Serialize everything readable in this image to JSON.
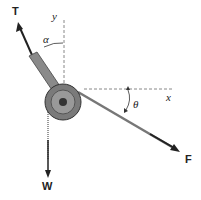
{
  "diagram": {
    "type": "free-body-diagram",
    "labels": {
      "tension": "T",
      "y_axis": "y",
      "alpha": "α",
      "x_axis": "x",
      "theta": "θ",
      "force": "F",
      "weight": "W"
    },
    "colors": {
      "arm": "#7a7a7a",
      "pulley": "#6e6e6e",
      "arrow": "#222222",
      "dashed": "#888888"
    }
  }
}
